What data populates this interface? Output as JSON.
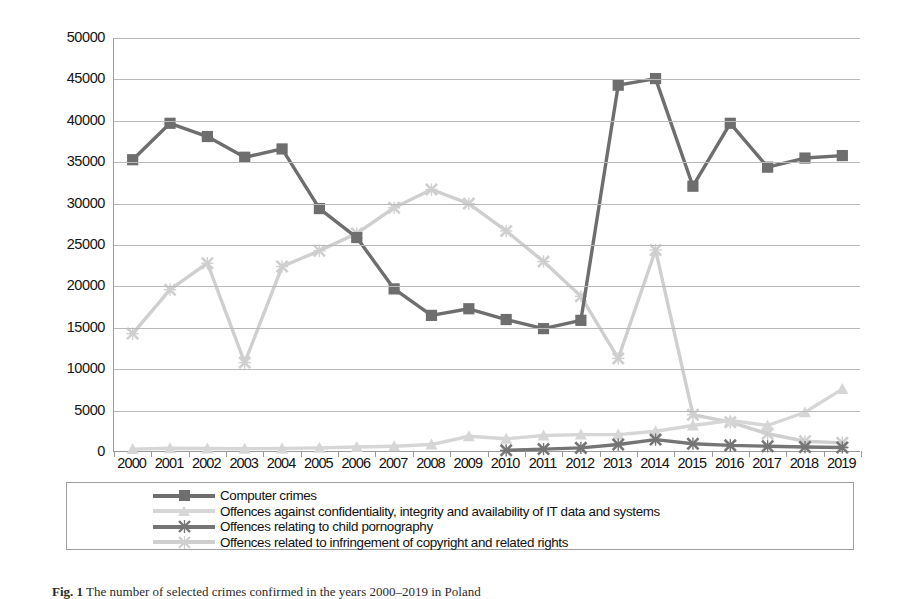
{
  "chart_data": {
    "type": "line",
    "title": "",
    "xlabel": "",
    "ylabel": "crime confirmed",
    "ylim": [
      0,
      50000
    ],
    "ytick_step": 5000,
    "yticks": [
      "0",
      "5000",
      "10000",
      "15000",
      "20000",
      "25000",
      "30000",
      "35000",
      "40000",
      "45000",
      "50000"
    ],
    "grid": true,
    "legend_position": "bottom",
    "categories": [
      "2000",
      "2001",
      "2002",
      "2003",
      "2004",
      "2005",
      "2006",
      "2007",
      "2008",
      "2009",
      "2010",
      "2011",
      "2012",
      "2013",
      "2014",
      "2015",
      "2016",
      "2017",
      "2018",
      "2019"
    ],
    "series": [
      {
        "name": "Computer crimes",
        "color": "#6e6e6e",
        "marker": "square",
        "values": [
          35300,
          39700,
          38100,
          35600,
          36600,
          29400,
          25900,
          19700,
          16500,
          17300,
          16000,
          14900,
          15900,
          44300,
          45100,
          32100,
          39700,
          34400,
          35500,
          35800
        ]
      },
      {
        "name": "Offences against confidentiality, integrity and availability of IT data and systems",
        "color": "#d6d6d6",
        "marker": "triangle",
        "values": [
          350,
          450,
          430,
          400,
          430,
          500,
          600,
          700,
          900,
          1900,
          1600,
          2000,
          2100,
          2100,
          2500,
          3200,
          3800,
          3200,
          4800,
          7600
        ]
      },
      {
        "name": "Offences relating to child pornography",
        "color": "#757575",
        "marker": "x",
        "values": [
          null,
          null,
          null,
          null,
          null,
          null,
          null,
          null,
          null,
          null,
          200,
          350,
          500,
          900,
          1500,
          1000,
          800,
          700,
          600,
          550
        ]
      },
      {
        "name": "Offences related to infringement of copyright and related rights",
        "color": "#cfcfcf",
        "marker": "x",
        "values": [
          14300,
          19600,
          22800,
          10800,
          22400,
          24300,
          26400,
          29500,
          31700,
          30000,
          26700,
          23000,
          18800,
          11300,
          24400,
          4500,
          3600,
          2200,
          1300,
          1100
        ]
      }
    ]
  },
  "axis": {
    "y_title": "crime confirmed"
  },
  "legend": {
    "items": [
      {
        "label": "Computer crimes"
      },
      {
        "label": "Offences against confidentiality, integrity and availability of IT data and systems"
      },
      {
        "label": "Offences relating to child pornography"
      },
      {
        "label": "Offences related to infringement of copyright and related rights"
      }
    ]
  },
  "caption": {
    "prefix": "Fig. 1",
    "text": "The number of selected crimes confirmed in the years 2000–2019 in Poland"
  }
}
